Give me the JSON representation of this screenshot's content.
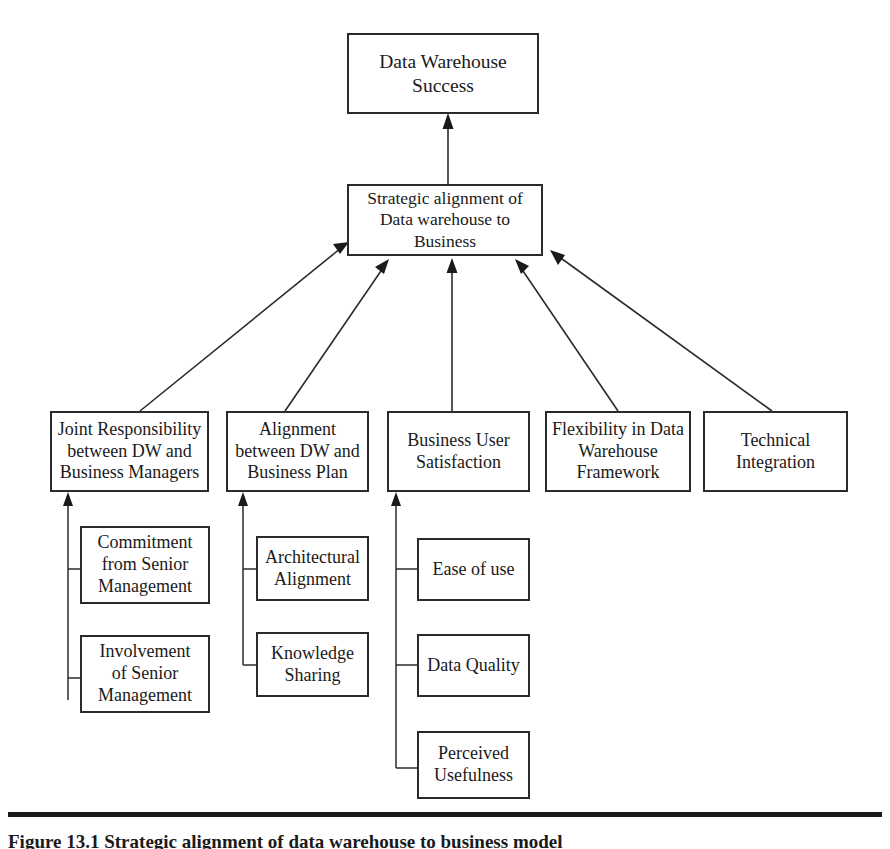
{
  "figure": {
    "caption": "Figure 13.1  Strategic alignment of data warehouse to business model",
    "rule_color": "#1a1a1a"
  },
  "diagram": {
    "type": "hierarchy-flow-diagram",
    "outcome": {
      "id": "data-warehouse-success",
      "label": "Data Warehouse\nSuccess"
    },
    "mediator": {
      "id": "strategic-alignment",
      "label": "Strategic alignment of\nData warehouse to\nBusiness"
    },
    "drivers": [
      {
        "id": "joint-responsibility",
        "label": "Joint Responsibility\nbetween DW and\nBusiness Managers",
        "sub_factors": [
          {
            "id": "commitment-senior-management",
            "label": "Commitment\nfrom Senior\nManagement"
          },
          {
            "id": "involvement-senior-management",
            "label": "Involvement\nof Senior\nManagement"
          }
        ]
      },
      {
        "id": "alignment-dw-business-plan",
        "label": "Alignment\nbetween DW and\nBusiness Plan",
        "sub_factors": [
          {
            "id": "architectural-alignment",
            "label": "Architectural\nAlignment"
          },
          {
            "id": "knowledge-sharing",
            "label": "Knowledge\nSharing"
          }
        ]
      },
      {
        "id": "business-user-satisfaction",
        "label": "Business User\nSatisfaction",
        "sub_factors": [
          {
            "id": "ease-of-use",
            "label": "Ease of use"
          },
          {
            "id": "data-quality",
            "label": "Data Quality"
          },
          {
            "id": "perceived-usefulness",
            "label": "Perceived\nUsefulness"
          }
        ]
      },
      {
        "id": "flexibility-dw-framework",
        "label": "Flexibility in Data\nWarehouse\nFramework",
        "sub_factors": []
      },
      {
        "id": "technical-integration",
        "label": "Technical\nIntegration",
        "sub_factors": []
      }
    ],
    "colors": {
      "box_border": "#2b2b2b",
      "box_fill": "#ffffff",
      "connector": "#2b2b2b",
      "text": "#1a1a1a"
    }
  }
}
